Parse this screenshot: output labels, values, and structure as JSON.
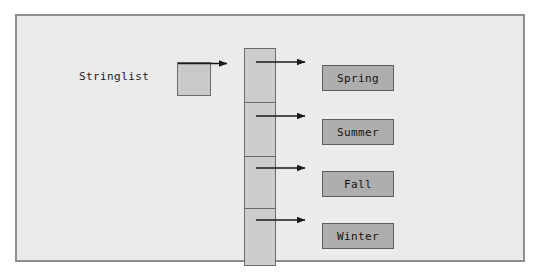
{
  "diagram": {
    "variable": {
      "label": "Stringlist",
      "name": "stringlist-variable-label"
    },
    "pointer_box": {
      "name": "pointer-box",
      "label": ""
    },
    "array": {
      "name": "array-column",
      "cell_count": 4,
      "cells": [
        {
          "index": "0",
          "label": ""
        },
        {
          "index": "1",
          "label": ""
        },
        {
          "index": "2",
          "label": ""
        },
        {
          "index": "3",
          "label": ""
        }
      ]
    },
    "values": [
      {
        "label": "Spring"
      },
      {
        "label": "Summer"
      },
      {
        "label": "Fall"
      },
      {
        "label": "Winter"
      }
    ],
    "arrows": [
      {
        "name": "arrow-variable-to-array",
        "from": "pointer-box",
        "to": "array-column"
      },
      {
        "name": "arrow-cell-0-to-spring",
        "from": "array-cell-0",
        "to": "value-box-spring"
      },
      {
        "name": "arrow-cell-1-to-summer",
        "from": "array-cell-1",
        "to": "value-box-summer"
      },
      {
        "name": "arrow-cell-2-to-fall",
        "from": "array-cell-2",
        "to": "value-box-fall"
      },
      {
        "name": "arrow-cell-3-to-winter",
        "from": "array-cell-3",
        "to": "value-box-winter"
      }
    ],
    "colors": {
      "panel_background": "#ebebeb",
      "panel_border": "#8e8e8e",
      "cell_fill": "#cdcdcd",
      "cell_border": "#6b6b6b",
      "value_fill": "#aeaeae",
      "value_border": "#5e5e5e",
      "arrow": "#1a1a1a",
      "text": "#111111"
    }
  }
}
